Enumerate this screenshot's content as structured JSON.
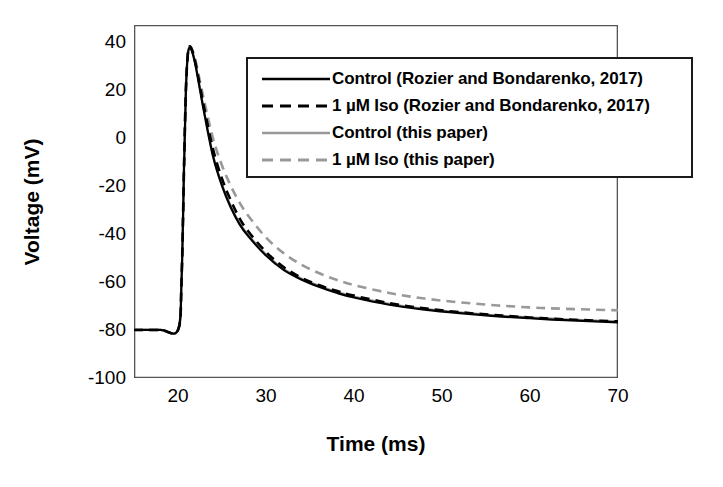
{
  "chart_data": {
    "type": "line",
    "title": "",
    "xlabel": "Time (ms)",
    "ylabel": "Voltage (mV)",
    "xlim": [
      15,
      70
    ],
    "ylim": [
      -100,
      47
    ],
    "grid": false,
    "legend_position": "upper-center",
    "xticks": [
      20,
      30,
      40,
      50,
      60,
      70
    ],
    "yticks": [
      40,
      20,
      0,
      -20,
      -40,
      -60,
      -80,
      -100
    ],
    "xtick_labels": [
      "20",
      "30",
      "40",
      "50",
      "60",
      "70"
    ],
    "ytick_labels": [
      "40",
      "20",
      "0",
      "-20",
      "-40",
      "-60",
      "-80",
      "-100"
    ],
    "series": [
      {
        "name": "Control (Rozier and Bondarenko, 2017)",
        "style": "solid",
        "color": "#000000",
        "width": 2.2,
        "x": [
          15,
          18,
          20,
          20.4,
          20.7,
          20.9,
          21.1,
          21.3,
          21.6,
          22,
          22.5,
          23,
          24,
          25,
          26,
          27,
          28,
          30,
          32,
          34,
          36,
          38,
          40,
          44,
          48,
          52,
          56,
          60,
          64,
          70
        ],
        "y": [
          -80,
          -80,
          -80,
          -60,
          -10,
          20,
          34,
          37.5,
          36,
          30,
          20,
          10,
          -8,
          -20,
          -29,
          -36,
          -41,
          -49,
          -55,
          -59,
          -62,
          -64.5,
          -66.5,
          -69.5,
          -71.5,
          -73,
          -74.2,
          -75.1,
          -75.9,
          -76.8
        ]
      },
      {
        "name": "1 µM Iso (Rozier and Bondarenko, 2017)",
        "style": "dashed",
        "color": "#000000",
        "width": 2.6,
        "x": [
          15,
          18,
          20,
          20.4,
          20.7,
          20.9,
          21.1,
          21.3,
          21.6,
          22,
          22.5,
          23,
          24,
          25,
          26,
          27,
          28,
          30,
          32,
          34,
          36,
          38,
          40,
          44,
          48,
          52,
          56,
          60,
          64,
          70
        ],
        "y": [
          -80,
          -80,
          -80,
          -60,
          -10,
          20,
          34,
          38,
          36.5,
          31,
          21.5,
          12,
          -5,
          -17,
          -26,
          -33.5,
          -39,
          -47.5,
          -53.8,
          -58.2,
          -61.3,
          -63.7,
          -65.7,
          -68.8,
          -71,
          -72.6,
          -73.8,
          -74.8,
          -75.6,
          -76.4
        ]
      },
      {
        "name": "Control (this paper)",
        "style": "solid",
        "color": "#999999",
        "width": 2.2,
        "x": [
          15,
          18,
          20,
          20.4,
          20.7,
          20.9,
          21.1,
          21.3,
          21.6,
          22,
          22.5,
          23,
          24,
          25,
          26,
          27,
          28,
          30,
          32,
          34,
          36,
          38,
          40,
          44,
          48,
          52,
          56,
          60,
          64,
          70
        ],
        "y": [
          -80,
          -80,
          -80,
          -58,
          -8,
          21,
          34.5,
          37.8,
          36.2,
          30.5,
          20.5,
          10.5,
          -7.5,
          -19.5,
          -28.5,
          -35.5,
          -40.5,
          -48.5,
          -54.6,
          -58.6,
          -61.6,
          -64.1,
          -66.1,
          -69.1,
          -71.2,
          -72.7,
          -73.9,
          -74.8,
          -75.6,
          -76.4
        ]
      },
      {
        "name": "1 µM Iso (this paper)",
        "style": "dashed",
        "color": "#999999",
        "width": 2.6,
        "x": [
          15,
          18,
          20,
          20.4,
          20.7,
          20.9,
          21.1,
          21.3,
          21.6,
          22,
          22.5,
          23,
          24,
          25,
          26,
          27,
          28,
          30,
          32,
          34,
          36,
          38,
          40,
          44,
          48,
          52,
          56,
          60,
          64,
          70
        ],
        "y": [
          -80,
          -80,
          -80,
          -58,
          -8,
          21,
          34.5,
          38,
          36.8,
          32,
          23.5,
          15,
          -0.5,
          -11.5,
          -20,
          -27,
          -32.5,
          -41.5,
          -48,
          -52.8,
          -56.3,
          -59.1,
          -61.3,
          -64.6,
          -66.9,
          -68.5,
          -69.7,
          -70.6,
          -71.2,
          -71.8
        ]
      }
    ],
    "legend_entries": [
      {
        "label": "Control (Rozier and Bondarenko, 2017)",
        "style": "solid",
        "color": "#000000"
      },
      {
        "label": "1 µM Iso (Rozier and Bondarenko, 2017)",
        "style": "dashed",
        "color": "#000000"
      },
      {
        "label": "Control (this paper)",
        "style": "solid",
        "color": "#999999"
      },
      {
        "label": "1 µM Iso (this paper)",
        "style": "dashed",
        "color": "#999999"
      }
    ]
  }
}
